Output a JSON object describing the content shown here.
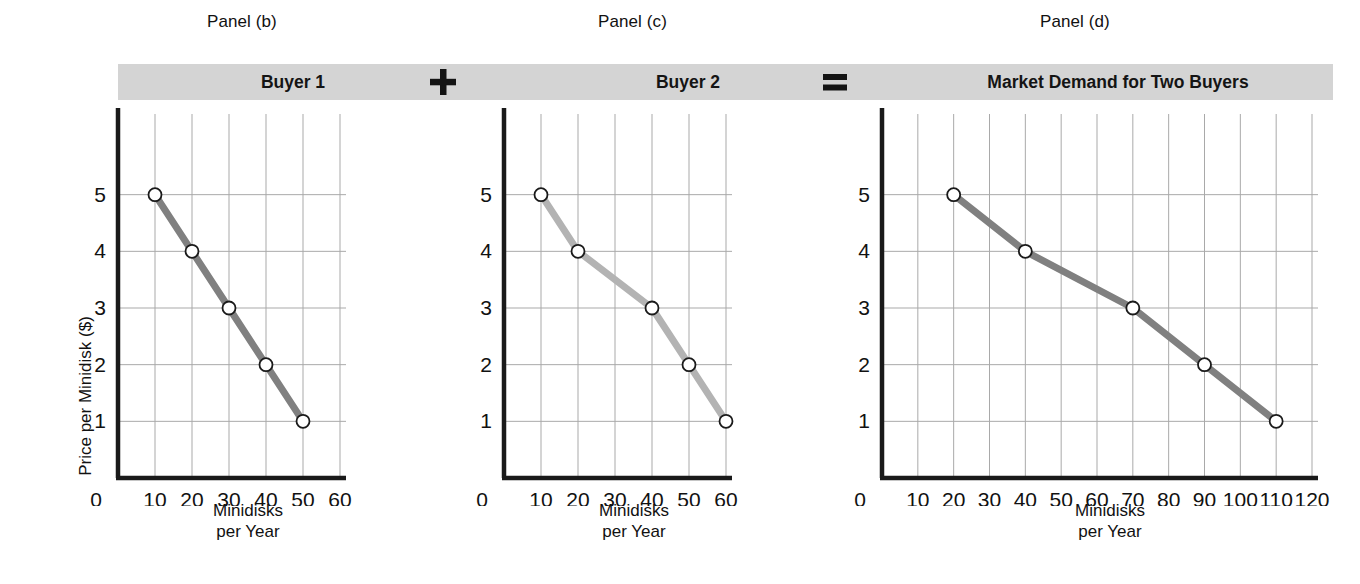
{
  "figure": {
    "panels": [
      {
        "caption": "Panel (b)",
        "banner_label": "Buyer 1",
        "operator": "plus-sign"
      },
      {
        "caption": "Panel (c)",
        "banner_label": "Buyer 2",
        "operator": "equals-sign"
      },
      {
        "caption": "Panel (d)",
        "banner_label": "Market Demand for Two Buyers",
        "operator": ""
      }
    ],
    "operators": {
      "plus": "+",
      "equals": "="
    },
    "axis_titles": {
      "y": "Price per Minidisk ($)",
      "x_line1": "Minidisks",
      "x_line2": "per Year"
    },
    "colors": {
      "banner_background": "#d4d4d4",
      "axis_line": "#1a1a1a",
      "grid_line": "#a9a9a9",
      "curve_dark": "#808080",
      "curve_light": "#b3b3b3",
      "marker_fill": "#ffffff",
      "marker_stroke": "#1a1a1a",
      "text": "#111111"
    }
  },
  "chart_data": [
    {
      "type": "line",
      "title": "Buyer 1",
      "panel": "Panel (b)",
      "xlabel": "Minidisks per Year",
      "ylabel": "Price per Minidisk ($)",
      "x": [
        10,
        20,
        30,
        40,
        50
      ],
      "y": [
        5,
        4,
        3,
        2,
        1
      ],
      "xticks": [
        0,
        10,
        20,
        30,
        40,
        50,
        60
      ],
      "yticks": [
        1,
        2,
        3,
        4,
        5
      ],
      "xlim": [
        0,
        60
      ],
      "ylim": [
        0,
        6
      ],
      "grid": true,
      "legend": "none",
      "series_color": "#808080",
      "marker": "open-circle"
    },
    {
      "type": "line",
      "title": "Buyer 2",
      "panel": "Panel (c)",
      "xlabel": "Minidisks per Year",
      "ylabel": "",
      "x": [
        10,
        20,
        40,
        50,
        60
      ],
      "y": [
        5,
        4,
        3,
        2,
        1
      ],
      "xticks": [
        0,
        10,
        20,
        30,
        40,
        50,
        60
      ],
      "yticks": [
        1,
        2,
        3,
        4,
        5
      ],
      "xlim": [
        0,
        60
      ],
      "ylim": [
        0,
        6
      ],
      "grid": true,
      "legend": "none",
      "series_color": "#b3b3b3",
      "marker": "open-circle"
    },
    {
      "type": "line",
      "title": "Market Demand for Two Buyers",
      "panel": "Panel (d)",
      "xlabel": "Minidisks per Year",
      "ylabel": "",
      "x": [
        20,
        40,
        70,
        90,
        110
      ],
      "y": [
        5,
        4,
        3,
        2,
        1
      ],
      "xticks": [
        0,
        10,
        20,
        30,
        40,
        50,
        60,
        70,
        80,
        90,
        100,
        110,
        120
      ],
      "yticks": [
        1,
        2,
        3,
        4,
        5
      ],
      "xlim": [
        0,
        120
      ],
      "ylim": [
        0,
        6
      ],
      "grid": true,
      "legend": "none",
      "series_color": "#808080",
      "marker": "open-circle"
    }
  ]
}
